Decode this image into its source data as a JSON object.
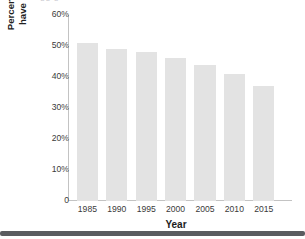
{
  "chart_data": {
    "type": "bar",
    "title": "",
    "xlabel": "Year",
    "ylabel_lines": [
      "Percentage of girls who",
      "have undergone FGM"
    ],
    "ylabel": "Percentage of girls who have undergone FGM",
    "categories": [
      "1985",
      "1990",
      "1995",
      "2000",
      "2005",
      "2010",
      "2015"
    ],
    "values": [
      51,
      49,
      48,
      46,
      44,
      41,
      37
    ],
    "ylim": [
      0,
      60
    ],
    "ytick_values": [
      0,
      10,
      20,
      30,
      40,
      50,
      60
    ],
    "ytick_labels": [
      "0",
      "10%",
      "20%",
      "30%",
      "40%",
      "50%",
      "60%"
    ],
    "grid": false,
    "legend": null,
    "bar_color": "#e3e3e3",
    "axis_color": "#c3c3c3",
    "text_color": "#3a3a3a"
  },
  "artifacts": {
    "clipped_title_ghost": "gg  g"
  }
}
